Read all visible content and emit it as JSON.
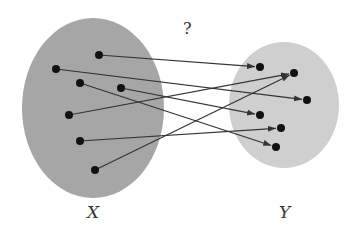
{
  "diagram": {
    "title_mark": "?",
    "sets": [
      {
        "id": "X",
        "label": "X",
        "color": "#a6a6a6",
        "points": [
          "x1",
          "x2",
          "x3",
          "x4",
          "x5",
          "x6",
          "x7"
        ]
      },
      {
        "id": "Y",
        "label": "Y",
        "color": "#cfcfcf",
        "points": [
          "y1",
          "y2",
          "y3",
          "y4",
          "y5",
          "y6"
        ]
      }
    ],
    "mappings": [
      {
        "from": "x1",
        "to": "y1"
      },
      {
        "from": "x2",
        "to": "y3"
      },
      {
        "from": "x3",
        "to": "y6"
      },
      {
        "from": "x4",
        "to": "y4"
      },
      {
        "from": "x5",
        "to": "y2"
      },
      {
        "from": "x6",
        "to": "y5"
      },
      {
        "from": "x7",
        "to": "y2"
      }
    ],
    "point_color": "#111111",
    "arrow_color": "#333333"
  }
}
